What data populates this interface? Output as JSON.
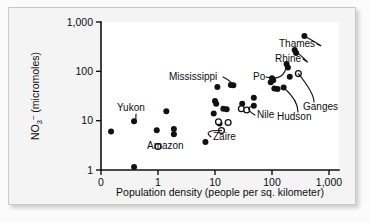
{
  "chart_data": {
    "type": "scatter",
    "title": "",
    "xlabel": "Population density (people per sq. kilometer)",
    "ylabel": "NO3- (micromoles)",
    "ylabel_parts": {
      "base": "NO",
      "sub": "3",
      "sup": "–",
      "rest": " (micromoles)"
    },
    "xscale": "log",
    "yscale": "log",
    "xlim": [
      0.1,
      1000
    ],
    "ylim": [
      1,
      1000
    ],
    "xticks": [
      0,
      1,
      10,
      100,
      1000
    ],
    "xtick_labels": [
      "0",
      "1",
      "10",
      "100",
      "1,000"
    ],
    "yticks": [
      1,
      10,
      100,
      1000
    ],
    "ytick_labels": [
      "1",
      "10",
      "100",
      "1,000"
    ],
    "grid": false,
    "legend": "none",
    "marker_types": {
      "filled": "filled-circle",
      "open": "open-circle"
    },
    "series": [
      {
        "name": "Rivers (filled markers)",
        "marker": "filled-circle",
        "points": [
          {
            "x": 0.15,
            "y": 6.0
          },
          {
            "x": 0.38,
            "y": 9.7
          },
          {
            "x": 0.38,
            "y": 1.15
          },
          {
            "x": 0.95,
            "y": 6.4
          },
          {
            "x": 1.4,
            "y": 15.5
          },
          {
            "x": 1.9,
            "y": 6.8
          },
          {
            "x": 1.9,
            "y": 5.3
          },
          {
            "x": 6.8,
            "y": 3.7
          },
          {
            "x": 9.5,
            "y": 14.0
          },
          {
            "x": 10.0,
            "y": 25.0
          },
          {
            "x": 10.5,
            "y": 22.0
          },
          {
            "x": 11.0,
            "y": 48.0
          },
          {
            "x": 12.0,
            "y": 8.8
          },
          {
            "x": 14.0,
            "y": 17.5
          },
          {
            "x": 16.0,
            "y": 17.0
          },
          {
            "x": 19.0,
            "y": 53.0
          },
          {
            "x": 21.0,
            "y": 52.0
          },
          {
            "x": 30.0,
            "y": 22.0
          },
          {
            "x": 48.0,
            "y": 29.0
          },
          {
            "x": 48.0,
            "y": 20.0
          },
          {
            "x": 95.0,
            "y": 60.0
          },
          {
            "x": 100.0,
            "y": 72.0
          },
          {
            "x": 105.0,
            "y": 66.0
          },
          {
            "x": 110.0,
            "y": 45.0
          },
          {
            "x": 125.0,
            "y": 44.0
          },
          {
            "x": 160.0,
            "y": 47.0
          },
          {
            "x": 180.0,
            "y": 140.0
          },
          {
            "x": 190.0,
            "y": 120.0
          },
          {
            "x": 205.0,
            "y": 78.0
          },
          {
            "x": 250.0,
            "y": 270.0
          },
          {
            "x": 265.0,
            "y": 235.0
          },
          {
            "x": 370.0,
            "y": 520.0
          }
        ]
      },
      {
        "name": "Rivers (open markers)",
        "marker": "open-circle",
        "points": [
          {
            "x": 1.0,
            "y": 3.0
          },
          {
            "x": 11.5,
            "y": 9.5
          },
          {
            "x": 13.0,
            "y": 6.3
          },
          {
            "x": 17.0,
            "y": 9.2
          },
          {
            "x": 29.0,
            "y": 17.5
          },
          {
            "x": 36.0,
            "y": 16.5
          },
          {
            "x": 290.0,
            "y": 90.0
          }
        ]
      }
    ],
    "annotations": [
      {
        "label": "Thames",
        "x": 370.0,
        "y": 520.0
      },
      {
        "label": "Rhine",
        "x": 250.0,
        "y": 270.0
      },
      {
        "label": "Po",
        "x": 180.0,
        "y": 140.0
      },
      {
        "label": "Ganges",
        "x": 290.0,
        "y": 90.0
      },
      {
        "label": "Hudson",
        "x": 160.0,
        "y": 47.0
      },
      {
        "label": "Mississippi",
        "x": 19.0,
        "y": 53.0
      },
      {
        "label": "Nile",
        "x": 48.0,
        "y": 20.0
      },
      {
        "label": "Zaire",
        "x": 13.0,
        "y": 6.3
      },
      {
        "label": "Amazon",
        "x": 1.0,
        "y": 3.0
      },
      {
        "label": "Yukon",
        "x": 0.38,
        "y": 9.7
      }
    ]
  },
  "colors": {
    "marker_fill": "#111111",
    "marker_stroke": "#111111",
    "axis": "#101010",
    "plot_background": "#ffffff",
    "card_background": "#f4f4f4",
    "page_background": "#fbfbfb"
  }
}
